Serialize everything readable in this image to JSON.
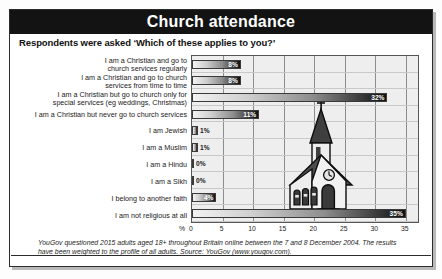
{
  "header": {
    "title": "Church attendance"
  },
  "question": "Respondents were asked ‘Which of these applies to you?’",
  "footer": "YouGov questioned 2015 adults aged 18+ throughout Britain online between the 7 and 8 December 2004. The results have been weighted to the profile of all adults. Source: YouGov (www.yougov.com).",
  "axis": {
    "unit_label": "%"
  },
  "colors": {
    "title_bar": "#131313",
    "plot_background": "#eeeeee",
    "bar_dark": "#111111",
    "bar_light": "#f2f2f2",
    "gridline": "#8d8d8d",
    "church_roof": "#4d4d4d",
    "church_wall": "#e8e8e8"
  },
  "chart_data": {
    "type": "bar",
    "orientation": "horizontal",
    "title": "Church attendance",
    "subtitle": "Respondents were asked ‘Which of these applies to you?’",
    "xlabel": "%",
    "ylabel": "",
    "xlim": [
      0,
      37
    ],
    "ticks": [
      0,
      5,
      10,
      15,
      20,
      25,
      30,
      35
    ],
    "tick_labels": [
      "0",
      "5",
      "10",
      "15",
      "20",
      "25",
      "30",
      "35"
    ],
    "grid": true,
    "legend": null,
    "categories": [
      "I am a Christian and go to\nchurch services regularly",
      "I am a Christian and go to church\nservices from time to time",
      "I am a Christian but go to church only for\nspecial services (eg weddings, Christmas)",
      "I am a Christian but never go to church services",
      "I am Jewish",
      "I am a Muslim",
      "I am a Hindu",
      "I am a Sikh",
      "I belong to another faith",
      "I am not religious at all"
    ],
    "values": [
      8,
      8,
      32,
      11,
      1,
      1,
      0,
      0,
      4,
      35
    ],
    "data_labels": [
      "8%",
      "8%",
      "32%",
      "11%",
      "1%",
      "1%",
      "0%",
      "0%",
      "4%",
      "35%"
    ],
    "annotations": [
      "church illustration overlaid on plot area"
    ]
  }
}
